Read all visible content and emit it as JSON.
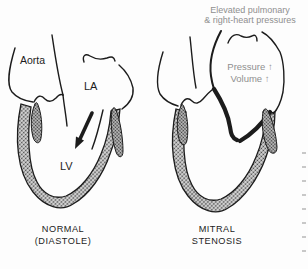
{
  "figure": {
    "top_annotation": {
      "line1": "Elevated pulmonary",
      "line2": "& right-heart pressures"
    },
    "normal_heart": {
      "aorta_label": "Aorta",
      "la_label": "LA",
      "lv_label": "LV",
      "caption_line1": "NORMAL",
      "caption_line2": "(DIASTOLE)"
    },
    "stenosis_heart": {
      "pressure_text": "Pressure ↑",
      "volume_text": "Volume ↑",
      "caption_line1": "MITRAL",
      "caption_line2": "STENOSIS"
    },
    "colors": {
      "ink": "#1c1c1c",
      "muted_text": "#8f8f8f",
      "wall_stipple_average": "#a6a6a6",
      "background": "#fdfdfd"
    }
  }
}
